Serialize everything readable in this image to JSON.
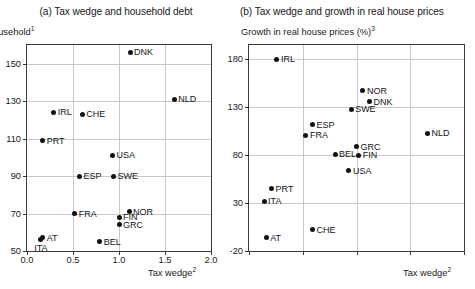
{
  "panels": [
    {
      "key": "a",
      "title": "(a) Tax wedge and household debt",
      "ylabel": "ousehold",
      "ylabel_sup": "1",
      "xlabel": "Tax wedge",
      "xlabel_sup": "2"
    },
    {
      "key": "b",
      "title": "(b) Tax wedge and growth in real house prices",
      "ylabel": "Growth in real house prices (%)",
      "ylabel_sup": "3",
      "xlabel": "Tax wedge",
      "xlabel_sup": "2"
    }
  ],
  "chart_data": [
    {
      "type": "scatter",
      "title": "(a) Tax wedge and household debt",
      "xlabel": "Tax wedge2",
      "ylabel": "Household debt1",
      "xlim": [
        0.0,
        2.0
      ],
      "ylim": [
        50,
        160
      ],
      "xticks": [
        "0.0",
        "0.5",
        "1.0",
        "1.5",
        "2.0"
      ],
      "xtickvalues": [
        0.0,
        0.5,
        1.0,
        1.5,
        2.0
      ],
      "yticks": [
        "150",
        "130",
        "110",
        "90",
        "70",
        "50"
      ],
      "ytickvalues": [
        150,
        130,
        110,
        90,
        70,
        50
      ],
      "grid": true,
      "legend": "none",
      "points": [
        {
          "label": "DNK",
          "x": 1.12,
          "y": 156,
          "pos": "right"
        },
        {
          "label": "NLD",
          "x": 1.6,
          "y": 131,
          "pos": "right"
        },
        {
          "label": "IRL",
          "x": 0.29,
          "y": 124,
          "pos": "right"
        },
        {
          "label": "CHE",
          "x": 0.6,
          "y": 123,
          "pos": "right"
        },
        {
          "label": "PRT",
          "x": 0.17,
          "y": 109,
          "pos": "right"
        },
        {
          "label": "USA",
          "x": 0.93,
          "y": 101,
          "pos": "right"
        },
        {
          "label": "ESP",
          "x": 0.57,
          "y": 90,
          "pos": "right"
        },
        {
          "label": "SWE",
          "x": 0.94,
          "y": 90,
          "pos": "right"
        },
        {
          "label": "FRA",
          "x": 0.52,
          "y": 70,
          "pos": "right"
        },
        {
          "label": "NOR",
          "x": 1.11,
          "y": 71,
          "pos": "right"
        },
        {
          "label": "FIN",
          "x": 1.0,
          "y": 68,
          "pos": "right"
        },
        {
          "label": "GRC",
          "x": 1.0,
          "y": 64,
          "pos": "right"
        },
        {
          "label": "AT",
          "x": 0.17,
          "y": 57,
          "pos": "right"
        },
        {
          "label": "ITA",
          "x": 0.15,
          "y": 56,
          "pos": "below"
        },
        {
          "label": "BEL",
          "x": 0.79,
          "y": 55,
          "pos": "right"
        }
      ]
    },
    {
      "type": "scatter",
      "title": "(b) Tax wedge and growth in real house prices",
      "xlabel": "Tax wedge2",
      "ylabel": "Growth in real house prices (%)3",
      "xlim": [
        0.0,
        2.0
      ],
      "ylim": [
        -20,
        195
      ],
      "xticks": [],
      "xtickvalues": [
        0.0,
        0.5,
        1.0,
        1.5,
        2.0
      ],
      "yticks": [
        "180",
        "130",
        "80",
        "30",
        "-20"
      ],
      "ytickvalues": [
        180,
        130,
        80,
        30,
        -20
      ],
      "grid": true,
      "legend": "none",
      "points": [
        {
          "label": "IRL",
          "x": 0.26,
          "y": 180,
          "pos": "right"
        },
        {
          "label": "NOR",
          "x": 1.06,
          "y": 147,
          "pos": "right"
        },
        {
          "label": "DNK",
          "x": 1.12,
          "y": 136,
          "pos": "right"
        },
        {
          "label": "SWE",
          "x": 0.95,
          "y": 128,
          "pos": "right"
        },
        {
          "label": "ESP",
          "x": 0.59,
          "y": 112,
          "pos": "right"
        },
        {
          "label": "FRA",
          "x": 0.53,
          "y": 101,
          "pos": "right"
        },
        {
          "label": "NLD",
          "x": 1.66,
          "y": 103,
          "pos": "right"
        },
        {
          "label": "GRC",
          "x": 1.0,
          "y": 89,
          "pos": "right"
        },
        {
          "label": "BEL",
          "x": 0.8,
          "y": 81,
          "pos": "right"
        },
        {
          "label": "FIN",
          "x": 1.02,
          "y": 80,
          "pos": "right"
        },
        {
          "label": "USA",
          "x": 0.93,
          "y": 64,
          "pos": "right"
        },
        {
          "label": "PRT",
          "x": 0.21,
          "y": 45,
          "pos": "right"
        },
        {
          "label": "ITA",
          "x": 0.14,
          "y": 32,
          "pos": "right"
        },
        {
          "label": "CHE",
          "x": 0.59,
          "y": 2,
          "pos": "right"
        },
        {
          "label": "AT",
          "x": 0.16,
          "y": -6,
          "pos": "right"
        }
      ]
    }
  ]
}
